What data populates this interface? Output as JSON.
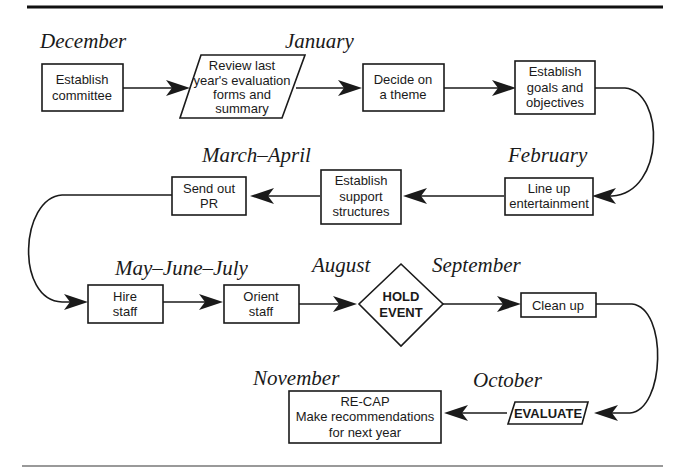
{
  "diagram": {
    "type": "annual event planning flowchart",
    "months": {
      "december": "December",
      "january": "January",
      "february": "February",
      "march_april": "March–April",
      "may_june_july": "May–June–July",
      "august": "August",
      "september": "September",
      "october": "October",
      "november": "November"
    },
    "nodes": {
      "establish_committee": {
        "shape": "rectangle",
        "lines": [
          "Establish",
          "committee"
        ]
      },
      "review_last_year": {
        "shape": "parallelogram",
        "lines": [
          "Review last",
          "year's evaluation",
          "forms and",
          "summary"
        ]
      },
      "decide_theme": {
        "shape": "rectangle",
        "lines": [
          "Decide on",
          "a theme"
        ]
      },
      "establish_goals": {
        "shape": "rectangle",
        "lines": [
          "Establish",
          "goals and",
          "objectives"
        ]
      },
      "line_up_entertainment": {
        "shape": "rectangle",
        "lines": [
          "Line up",
          "entertainment"
        ]
      },
      "establish_support": {
        "shape": "rectangle",
        "lines": [
          "Establish",
          "support",
          "structures"
        ]
      },
      "send_out_pr": {
        "shape": "rectangle",
        "lines": [
          "Send out",
          "PR"
        ]
      },
      "hire_staff": {
        "shape": "rectangle",
        "lines": [
          "Hire",
          "staff"
        ]
      },
      "orient_staff": {
        "shape": "rectangle",
        "lines": [
          "Orient",
          "staff"
        ]
      },
      "hold_event": {
        "shape": "diamond",
        "lines": [
          "HOLD",
          "EVENT"
        ]
      },
      "clean_up": {
        "shape": "rectangle",
        "lines": [
          "Clean up"
        ]
      },
      "evaluate": {
        "shape": "parallelogram",
        "lines": [
          "EVALUATE"
        ]
      },
      "recap": {
        "shape": "rectangle",
        "lines": [
          "RE-CAP",
          "Make recommendations",
          "for next year"
        ]
      }
    },
    "flow": [
      "establish_committee",
      "review_last_year",
      "decide_theme",
      "establish_goals",
      "line_up_entertainment",
      "establish_support",
      "send_out_pr",
      "hire_staff",
      "orient_staff",
      "hold_event",
      "clean_up",
      "evaluate",
      "recap"
    ]
  }
}
